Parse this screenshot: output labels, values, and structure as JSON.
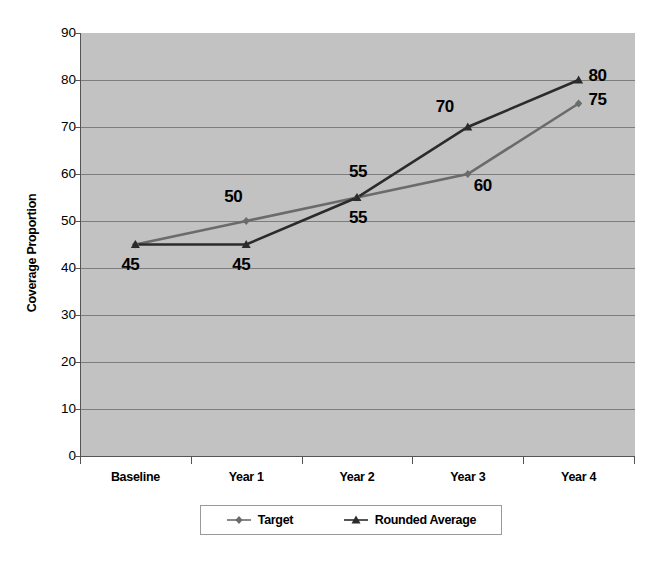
{
  "chart_data": {
    "type": "line",
    "title": "",
    "xlabel": "",
    "ylabel": "Coverage Proportion",
    "categories": [
      "Baseline",
      "Year 1",
      "Year 2",
      "Year 3",
      "Year 4"
    ],
    "series": [
      {
        "name": "Target",
        "color": "#6b6b6b",
        "marker": "diamond",
        "values": [
          45,
          50,
          55,
          60,
          75
        ],
        "labels": [
          "45",
          "50",
          "55",
          "60",
          "75"
        ]
      },
      {
        "name": "Rounded Average",
        "color": "#2b2b2b",
        "marker": "triangle",
        "values": [
          45,
          45,
          55,
          70,
          80
        ],
        "labels": [
          "45",
          "45",
          "55",
          "70",
          "80"
        ]
      }
    ],
    "ylim": [
      0,
      90
    ],
    "ytick_labels": [
      "90",
      "80",
      "70",
      "60",
      "50",
      "40",
      "30",
      "20",
      "10",
      "0"
    ],
    "ytick_values": [
      90,
      80,
      70,
      60,
      50,
      40,
      30,
      20,
      10,
      0
    ],
    "grid": true,
    "legend_position": "bottom",
    "plot_background": "#c2c2c2",
    "gridline_color": "#7d7d7d",
    "axis_color": "#555555",
    "page_background": "#ffffff"
  },
  "annotations": {
    "visible_data_labels": [
      {
        "text": "45",
        "series": "Rounded Average",
        "category": "Baseline"
      },
      {
        "text": "45",
        "series": "Rounded Average",
        "category": "Year 1"
      },
      {
        "text": "50",
        "series": "Target",
        "category": "Year 1"
      },
      {
        "text": "55",
        "series": "Rounded Average",
        "category": "Year 2"
      },
      {
        "text": "55",
        "series": "Target",
        "category": "Year 2"
      },
      {
        "text": "70",
        "series": "Rounded Average",
        "category": "Year 3"
      },
      {
        "text": "60",
        "series": "Target",
        "category": "Year 3"
      },
      {
        "text": "80",
        "series": "Rounded Average",
        "category": "Year 4"
      },
      {
        "text": "75",
        "series": "Target",
        "category": "Year 4"
      }
    ]
  },
  "legend": {
    "entries": [
      {
        "label": "Target",
        "marker": "diamond",
        "color": "#6b6b6b"
      },
      {
        "label": "Rounded Average",
        "marker": "triangle",
        "color": "#2b2b2b"
      }
    ]
  }
}
